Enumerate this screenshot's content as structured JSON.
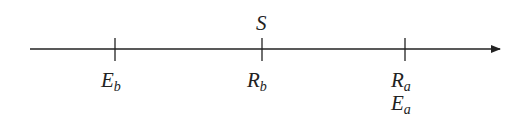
{
  "diagram": {
    "type": "number-line",
    "axis": {
      "x_start": 30,
      "x_end": 500,
      "y": 49,
      "color": "#222222",
      "arrow": "right"
    },
    "ticks": [
      {
        "x": 115,
        "below": [
          {
            "main": "E",
            "sub": "b"
          }
        ],
        "above": null
      },
      {
        "x": 262,
        "below": [
          {
            "main": "R",
            "sub": "b"
          }
        ],
        "above": {
          "main": "S",
          "sub": ""
        }
      },
      {
        "x": 405,
        "below": [
          {
            "main": "R",
            "sub": "a"
          },
          {
            "main": "E",
            "sub": "a"
          }
        ],
        "above": null
      }
    ]
  },
  "labels": {
    "S": "S",
    "Eb": {
      "main": "E",
      "sub": "b"
    },
    "Rb": {
      "main": "R",
      "sub": "b"
    },
    "Ra": {
      "main": "R",
      "sub": "a"
    },
    "Ea": {
      "main": "E",
      "sub": "a"
    }
  }
}
